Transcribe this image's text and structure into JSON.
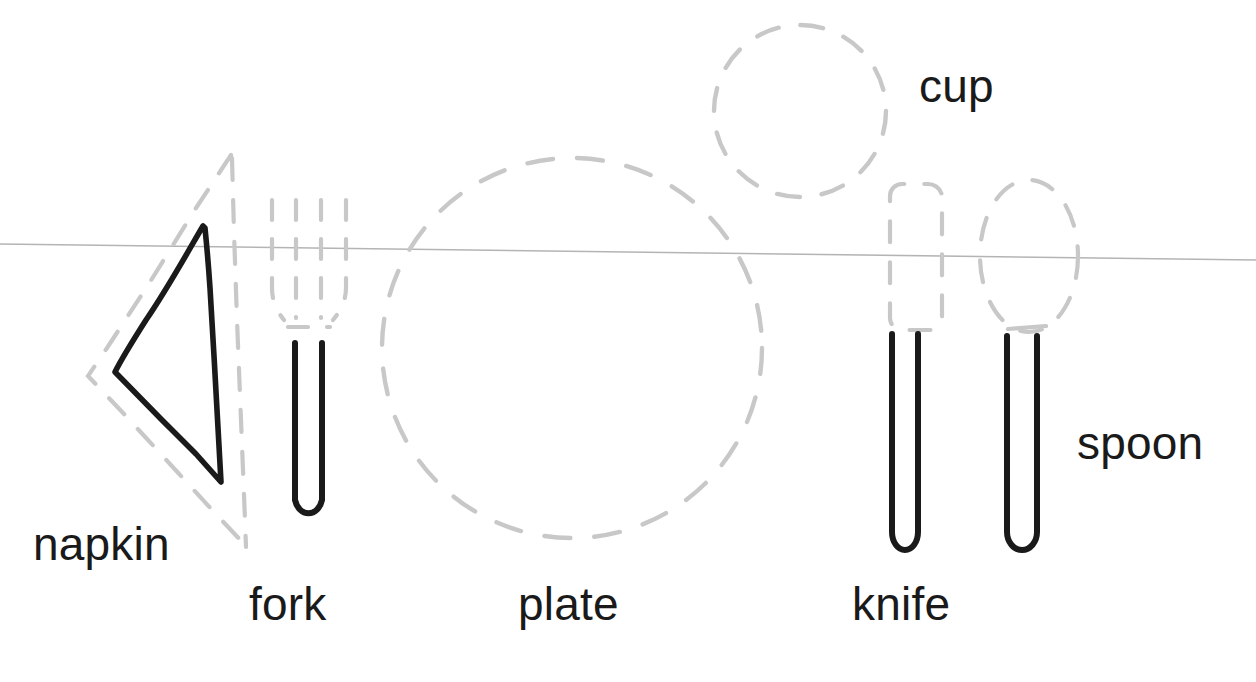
{
  "diagram": {
    "background_color": "#ffffff",
    "ink_color": "#1a1a1a",
    "guide_color": "#c8c8c8",
    "table_edge_color": "#b4b4b4"
  },
  "table_edge": {
    "name": "table-edge-line",
    "x1": 0,
    "y1": 244,
    "x2": 1256,
    "y2": 260,
    "color": "#b4b4b4",
    "width": 1.6
  },
  "items": [
    {
      "id": "napkin",
      "label": "napkin",
      "label_x": 33,
      "label_y": 521,
      "font_size": 46,
      "guide_shape": "dashed-triangle",
      "solid_shape": "folded-napkin"
    },
    {
      "id": "fork",
      "label": "fork",
      "label_x": 249,
      "label_y": 581,
      "font_size": 46,
      "guide_shape": "dashed-tines",
      "solid_shape": "u-handle"
    },
    {
      "id": "plate",
      "label": "plate",
      "label_x": 518,
      "label_y": 581,
      "font_size": 46,
      "guide_shape": "dashed-circle",
      "solid_shape": "none"
    },
    {
      "id": "knife",
      "label": "knife",
      "label_x": 852,
      "label_y": 581,
      "font_size": 46,
      "guide_shape": "dashed-blade",
      "solid_shape": "u-handle"
    },
    {
      "id": "cup",
      "label": "cup",
      "label_x": 919,
      "label_y": 63,
      "font_size": 46,
      "guide_shape": "dashed-circle",
      "solid_shape": "none"
    },
    {
      "id": "spoon",
      "label": "spoon",
      "label_x": 1077,
      "label_y": 420,
      "font_size": 46,
      "guide_shape": "dashed-oval",
      "solid_shape": "u-handle"
    }
  ],
  "geometry": {
    "napkin_guide_path": "M 230 156 L 88 375 L 246 546 L 233 330 Z",
    "napkin_solid_path": "M 204 228 C 176 268 136 338 116 372 L 221 482 C 218 400 212 300 207 232 Z",
    "fork_tines": [
      {
        "x": 274,
        "y_top": 200,
        "y_bot": 306,
        "curl": "left"
      },
      {
        "x": 297,
        "y_top": 200,
        "y_bot": 312,
        "curl": "none"
      },
      {
        "x": 320,
        "y_top": 200,
        "y_bot": 312,
        "curl": "none"
      },
      {
        "x": 345,
        "y_top": 200,
        "y_bot": 306,
        "curl": "right"
      }
    ],
    "fork_handle": {
      "x_left": 294,
      "x_right": 322,
      "y_top": 342,
      "y_bot": 522
    },
    "plate_circle": {
      "cx": 572,
      "cy": 348,
      "r": 190
    },
    "cup_circle": {
      "cx": 800,
      "cy": 111,
      "r": 86
    },
    "knife_blade": {
      "x": 888,
      "y": 182,
      "w": 54,
      "h": 150
    },
    "knife_handle": {
      "x_left": 891,
      "x_right": 918,
      "y_top": 333,
      "y_bot": 552
    },
    "spoon_bowl": {
      "cx": 1029,
      "cy": 256,
      "rx": 49,
      "ry": 76
    },
    "spoon_handle": {
      "x_left": 1006,
      "x_right": 1037,
      "y_top": 334,
      "y_bot": 552
    }
  },
  "labels": {
    "napkin": "napkin",
    "fork": "fork",
    "plate": "plate",
    "knife": "knife",
    "cup": "cup",
    "spoon": "spoon"
  }
}
